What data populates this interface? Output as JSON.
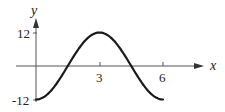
{
  "chart_data": {
    "type": "line",
    "title": "",
    "xlabel": "x",
    "ylabel": "y",
    "x_ticks": [
      {
        "value": 3,
        "label": "3"
      },
      {
        "value": 6,
        "label": "6"
      }
    ],
    "y_ticks": [
      {
        "value": 12,
        "label": "12"
      },
      {
        "value": -12,
        "label": "-12"
      }
    ],
    "xlim": [
      0,
      6
    ],
    "ylim": [
      -12,
      12
    ],
    "grid": false,
    "legend": null,
    "series": [
      {
        "name": "y = -12cos(πx/3)",
        "x": [
          0,
          0.5,
          1,
          1.5,
          2,
          2.5,
          3,
          3.5,
          4,
          4.5,
          5,
          5.5,
          6
        ],
        "values": [
          -12,
          -10.39,
          -6,
          0,
          6,
          10.39,
          12,
          10.39,
          6,
          0,
          -6,
          -10.39,
          -12
        ]
      }
    ],
    "color": "#1a1a1a",
    "axis_color": "#555555"
  }
}
